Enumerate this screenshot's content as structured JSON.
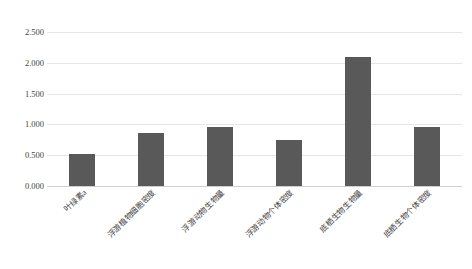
{
  "chart_data": {
    "type": "bar",
    "title": "",
    "xlabel": "",
    "ylabel": "",
    "ylim": [
      0,
      2.5
    ],
    "grid": true,
    "legend": false,
    "bar_color": "#595959",
    "gridline_color": "#e6e6e6",
    "background_color": "#ffffff",
    "ytick_labels": [
      "0.000",
      "0.500",
      "1.000",
      "1.500",
      "2.000",
      "2.500"
    ],
    "ytick_values": [
      0.0,
      0.5,
      1.0,
      1.5,
      2.0,
      2.5
    ],
    "categories": [
      "叶绿素a",
      "浮游植物细胞密度",
      "浮游动物生物量",
      "浮游动物个体密度",
      "底栖生物生物量",
      "底栖生物个体密度"
    ],
    "values": [
      0.52,
      0.86,
      0.95,
      0.75,
      2.1,
      0.95
    ]
  }
}
